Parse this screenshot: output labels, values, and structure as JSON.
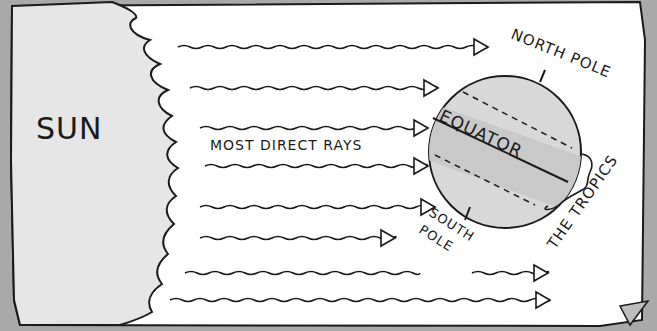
{
  "diagram": {
    "labels": {
      "sun": "SUN",
      "most_direct_rays": "MOST DIRECT RAYS",
      "equator": "EQUATOR",
      "north_pole": "NORTH POLE",
      "south_pole_line1": "SOUTH",
      "south_pole_line2": "POLE",
      "tropics": "THE TROPICS"
    },
    "colors": {
      "background": "#a9a9a9",
      "sun_fill": "#e6e6e6",
      "paper": "#ffffff",
      "ink": "#1a1a1a",
      "earth_fill": "#d8d8d8",
      "tropic_band_fill": "#c9c9c9"
    },
    "rays": [
      {
        "y": 47,
        "x1": 178,
        "x2": 488
      },
      {
        "y": 88,
        "x1": 190,
        "x2": 438
      },
      {
        "y": 128,
        "x1": 200,
        "x2": 428
      },
      {
        "y": 166,
        "x1": 205,
        "x2": 428
      },
      {
        "y": 207,
        "x1": 200,
        "x2": 435
      },
      {
        "y": 238,
        "x1": 200,
        "x2": 395
      },
      {
        "y": 273,
        "x1": 185,
        "x2": 420,
        "gap_to": 472,
        "x3": 548
      },
      {
        "y": 300,
        "x1": 170,
        "x2": 550
      }
    ]
  }
}
